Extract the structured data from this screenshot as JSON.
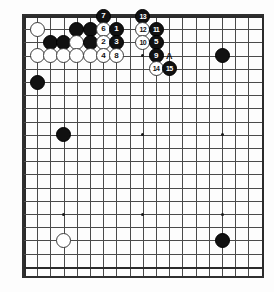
{
  "diagram": {
    "type": "go-board-diagram",
    "board_size": 19,
    "visible_columns": 18,
    "visible_rows": 20,
    "colors": {
      "black_stone": "#111111",
      "white_stone": "#ffffff",
      "grid_line": "#4a4a4a",
      "border": "#2f2f2f",
      "background": "#ffffff"
    },
    "hoshi_points": [
      {
        "col": 3,
        "row": 9
      },
      {
        "col": 9,
        "row": 9
      },
      {
        "col": 15,
        "row": 9
      },
      {
        "col": 3,
        "row": 15
      },
      {
        "col": 9,
        "row": 15
      },
      {
        "col": 15,
        "row": 15
      },
      {
        "col": 3,
        "row": 3
      },
      {
        "col": 9,
        "row": 3
      },
      {
        "col": 15,
        "row": 3
      }
    ],
    "plain_stones": [
      {
        "col": 1,
        "row": 1,
        "color": "white"
      },
      {
        "col": 4,
        "row": 1,
        "color": "black"
      },
      {
        "col": 5,
        "row": 1,
        "color": "black"
      },
      {
        "col": 2,
        "row": 2,
        "color": "black"
      },
      {
        "col": 3,
        "row": 2,
        "color": "black"
      },
      {
        "col": 4,
        "row": 2,
        "color": "white"
      },
      {
        "col": 5,
        "row": 2,
        "color": "black"
      },
      {
        "col": 1,
        "row": 3,
        "color": "white"
      },
      {
        "col": 2,
        "row": 3,
        "color": "white"
      },
      {
        "col": 3,
        "row": 3,
        "color": "white"
      },
      {
        "col": 4,
        "row": 3,
        "color": "white"
      },
      {
        "col": 5,
        "row": 3,
        "color": "white"
      },
      {
        "col": 1,
        "row": 5,
        "color": "black"
      },
      {
        "col": 3,
        "row": 9,
        "color": "black"
      },
      {
        "col": 15,
        "row": 3,
        "color": "black"
      },
      {
        "col": 3,
        "row": 17,
        "color": "white"
      },
      {
        "col": 15,
        "row": 17,
        "color": "black"
      }
    ],
    "numbered_moves": [
      {
        "num": "7",
        "col": 6,
        "row": 0,
        "color": "black"
      },
      {
        "num": "13",
        "col": 9,
        "row": 0,
        "color": "black"
      },
      {
        "num": "6",
        "col": 6,
        "row": 1,
        "color": "white"
      },
      {
        "num": "1",
        "col": 7,
        "row": 1,
        "color": "black"
      },
      {
        "num": "12",
        "col": 9,
        "row": 1,
        "color": "white"
      },
      {
        "num": "11",
        "col": 10,
        "row": 1,
        "color": "black"
      },
      {
        "num": "2",
        "col": 6,
        "row": 2,
        "color": "white"
      },
      {
        "num": "3",
        "col": 7,
        "row": 2,
        "color": "black"
      },
      {
        "num": "10",
        "col": 9,
        "row": 2,
        "color": "white"
      },
      {
        "num": "5",
        "col": 10,
        "row": 2,
        "color": "black"
      },
      {
        "num": "4",
        "col": 6,
        "row": 3,
        "color": "white"
      },
      {
        "num": "8",
        "col": 7,
        "row": 3,
        "color": "white"
      },
      {
        "num": "9",
        "col": 10,
        "row": 3,
        "color": "black"
      },
      {
        "num": "14",
        "col": 10,
        "row": 4,
        "color": "white"
      },
      {
        "num": "15",
        "col": 11,
        "row": 4,
        "color": "black"
      }
    ],
    "point_labels": [
      {
        "text": "A",
        "col": 11,
        "row": 3
      }
    ]
  }
}
